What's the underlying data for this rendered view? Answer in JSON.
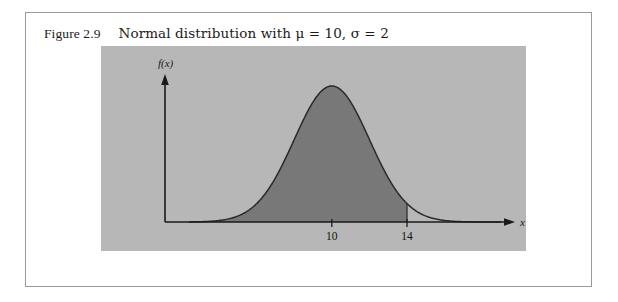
{
  "figure": {
    "caption_number": "Figure 2.9",
    "caption_text": "Normal distribution with μ = 10, σ = 2"
  },
  "chart_data": {
    "type": "area",
    "title": "Normal distribution with μ = 10, σ = 2",
    "distribution": "normal",
    "mu": 10,
    "sigma": 2,
    "xlabel": "x",
    "ylabel": "f(x)",
    "grid": false,
    "legend": null,
    "xlim": [
      2.4,
      19.0
    ],
    "ylim": [
      0,
      0.22
    ],
    "x_ticks": [
      10,
      14
    ],
    "x_tick_labels": [
      "10",
      "14"
    ],
    "y_ticks": [],
    "shaded_region": {
      "label": "",
      "from": 2.4,
      "to": 14,
      "boundary_line_at": 14,
      "fill_color": "#787878"
    },
    "curve_color": "#2a2a2a",
    "panel_color": "#b7b7b7",
    "axis_color": "#1a1a1a",
    "x": [
      2.4,
      3.0,
      3.6,
      4.2,
      4.8,
      5.4,
      6.0,
      6.6,
      7.2,
      7.8,
      8.4,
      9.0,
      9.6,
      10.0,
      10.4,
      11.0,
      11.6,
      12.2,
      12.8,
      13.4,
      14.0,
      14.6,
      15.2,
      15.8,
      16.4,
      17.0,
      17.6,
      18.2,
      19.0
    ],
    "y": [
      0.0002,
      0.0009,
      0.0022,
      0.0051,
      0.0104,
      0.0194,
      0.0332,
      0.0519,
      0.074,
      0.0966,
      0.116,
      0.1296,
      0.1368,
      0.1383,
      0.1368,
      0.1296,
      0.116,
      0.0966,
      0.074,
      0.0519,
      0.0332,
      0.0194,
      0.0104,
      0.0051,
      0.0022,
      0.0009,
      0.0003,
      0.0001,
      2e-05
    ]
  },
  "labels": {
    "y_axis": "f(x)",
    "x_axis": "x",
    "tick_10": "10",
    "tick_14": "14"
  }
}
